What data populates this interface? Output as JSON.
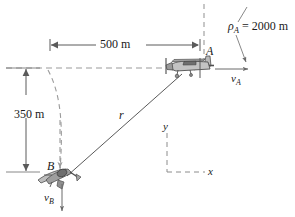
{
  "figure": {
    "type": "engineering-kinematics-diagram",
    "colors": {
      "line": "#4a4a4a",
      "dashed": "#8c8c8c",
      "text": "#1a1a1a",
      "aircraft_body": "#b9b9b9",
      "aircraft_outline": "#4f4f4f",
      "aircraft_shade": "#8f8f8f"
    }
  },
  "labels": {
    "rho_a": "ρ",
    "rho_a_sub": "A",
    "rho_a_value": " = 2000 m",
    "dim_horizontal": "500 m",
    "dim_vertical": "350 m",
    "point_a": "A",
    "point_b": "B",
    "vector_r": "r",
    "velocity_a": "v",
    "velocity_a_sub": "A",
    "velocity_b": "v",
    "velocity_b_sub": "B",
    "axis_y": "y",
    "axis_x": "x"
  },
  "values": {
    "radius_of_curvature_A_m": 2000,
    "horizontal_separation_m": 500,
    "vertical_separation_m": 350
  }
}
